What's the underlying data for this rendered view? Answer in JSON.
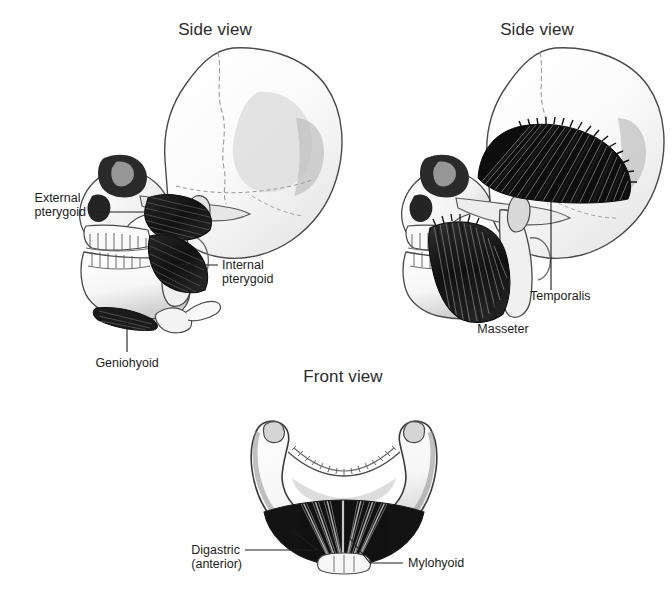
{
  "figure": {
    "background_color": "#ffffff",
    "width": 672,
    "height": 590
  },
  "titles": {
    "left_side_view": "Side view",
    "right_side_view": "Side view",
    "front_view": "Front view"
  },
  "panels": [
    {
      "id": "left-skull",
      "title": "Side view",
      "labels": [
        "External pterygoid",
        "Internal pterygoid",
        "Geniohyoid"
      ]
    },
    {
      "id": "right-skull",
      "title": "Side view",
      "labels": [
        "Temporalis",
        "Masseter"
      ]
    },
    {
      "id": "front-mandible",
      "title": "Front view",
      "labels": [
        "Digastric",
        "(anterior)",
        "Mylohyoid"
      ]
    }
  ],
  "annotations": {
    "external_pterygoid_line1": "External",
    "external_pterygoid_line2": "pterygoid",
    "internal_pterygoid_line1": "Internal",
    "internal_pterygoid_line2": "pterygoid",
    "geniohyoid": "Geniohyoid",
    "temporalis": "Temporalis",
    "masseter": "Masseter",
    "digastric_line1": "Digastric",
    "digastric_line2": "(anterior)",
    "mylohyoid": "Mylohyoid"
  },
  "colors": {
    "background": "#ffffff",
    "bone_light": "#fbfbfb",
    "bone_mid": "#d6d6d6",
    "bone_shadow": "#a8a8a8",
    "bone_dark": "#6e6e6e",
    "outline": "#3a3a3a",
    "muscle_dark": "#171717",
    "muscle_fiber": "#4c4c4c",
    "cavity_black": "#1a1a1a",
    "text": "#1c1c1c",
    "title_text": "#2b2b2b",
    "leader_line": "#1c1c1c"
  }
}
